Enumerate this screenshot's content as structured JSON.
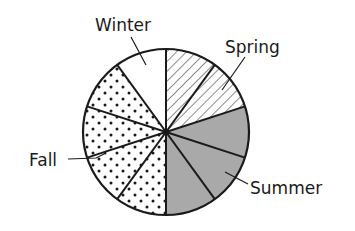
{
  "chart_data": {
    "type": "pie",
    "title": "",
    "categories": [
      "Spring",
      "Summer",
      "Fall",
      "Winter"
    ],
    "values": [
      2,
      3,
      4,
      1
    ],
    "unit_slices_total": 10,
    "slice_order": "clockwise from 12 o'clock: Spring, Summer, Fall, Winter",
    "legend": "none (direct labels with leader lines)",
    "series": [
      {
        "name": "Spring",
        "slices": 2,
        "pattern": "diagonal-hatch",
        "color": "#ffffff"
      },
      {
        "name": "Summer",
        "slices": 3,
        "pattern": "solid",
        "color": "#a9a9a9"
      },
      {
        "name": "Fall",
        "slices": 4,
        "pattern": "dots",
        "color": "#ffffff"
      },
      {
        "name": "Winter",
        "slices": 1,
        "pattern": "none",
        "color": "#ffffff"
      }
    ]
  },
  "labels": {
    "winter": "Winter",
    "spring": "Spring",
    "fall": "Fall",
    "summer": "Summer"
  },
  "colors": {
    "stroke": "#1a1a1a",
    "summer_fill": "#a9a9a9",
    "background": "#ffffff"
  }
}
